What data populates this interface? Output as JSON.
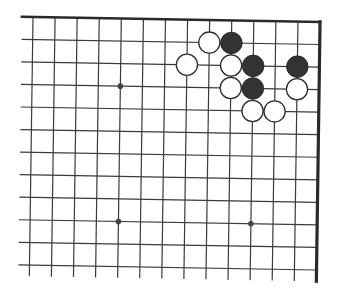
{
  "diagram": {
    "type": "go-board-fragment",
    "region": "top-right corner",
    "columns": 14,
    "rows": 12,
    "edges": {
      "top": true,
      "right": true,
      "left": false,
      "bottom": false
    },
    "colors": {
      "background": "#ffffff",
      "line": "#3a3a3a",
      "edge": "#2a2a2a",
      "black_stone": "#333333",
      "white_stone_fill": "#ffffff",
      "white_stone_stroke": "#2e2e2e",
      "star_point": "#444444"
    },
    "star_points": [
      {
        "col": 4,
        "row": 3
      },
      {
        "col": 4,
        "row": 9
      },
      {
        "col": 10,
        "row": 9
      }
    ],
    "stones": [
      {
        "color": "white",
        "col": 8,
        "row": 1
      },
      {
        "color": "black",
        "col": 9,
        "row": 1
      },
      {
        "color": "white",
        "col": 7,
        "row": 2
      },
      {
        "color": "white",
        "col": 9,
        "row": 2
      },
      {
        "color": "black",
        "col": 10,
        "row": 2
      },
      {
        "color": "black",
        "col": 12,
        "row": 2
      },
      {
        "color": "white",
        "col": 9,
        "row": 3
      },
      {
        "color": "black",
        "col": 10,
        "row": 3
      },
      {
        "color": "white",
        "col": 12,
        "row": 3
      },
      {
        "color": "white",
        "col": 10,
        "row": 4
      },
      {
        "color": "white",
        "col": 11,
        "row": 4
      }
    ]
  }
}
